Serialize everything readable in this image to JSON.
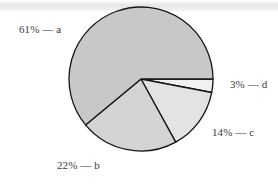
{
  "chart_data": {
    "type": "pie",
    "title": "",
    "categories": [
      "a",
      "b",
      "c",
      "d"
    ],
    "values": [
      61,
      22,
      14,
      3
    ],
    "unit": "%",
    "labels": [
      "61% — a",
      "22% — b",
      "14% — c",
      "3% — d"
    ],
    "colors": [
      "#c8c8c8",
      "#d4d4d4",
      "#e3e3e3",
      "#f1f1f1"
    ],
    "start_angle_deg": 0,
    "direction": "clockwise-from-d",
    "legend": "none (inline labels)"
  },
  "labels": {
    "a": "61% — a",
    "b": "22% — b",
    "c": "14% — c",
    "d": "3% — d"
  }
}
